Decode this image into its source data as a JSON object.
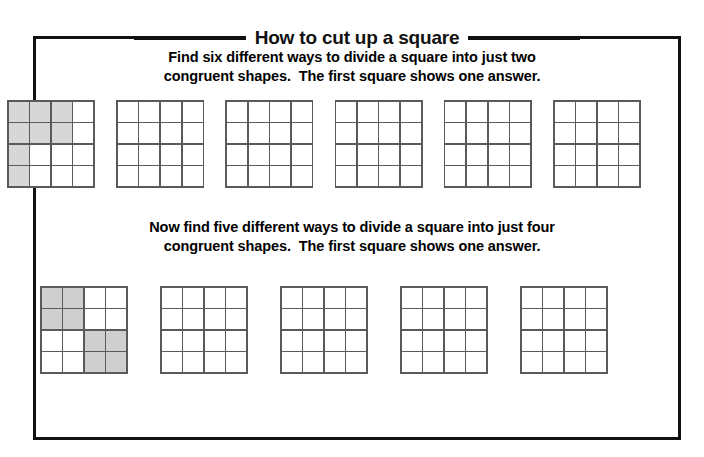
{
  "title": "How to cut up a square",
  "colors": {
    "border": "#111111",
    "grid_line": "#5a5a5a",
    "shade_row1": "#d7d7d7",
    "shade_row2": "#cfcfcf",
    "page_background": "#ffffff"
  },
  "section_1": {
    "instruction_line_1": "Find six different ways to divide a square into just two",
    "instruction_line_2": "congruent shapes.  The first square shows one answer.",
    "grid_count": 6,
    "grid_rows": 4,
    "grid_cols": 4,
    "grids": [
      {
        "label": "example-answer-two-congruent-shapes",
        "shaded_cells": [
          [
            1,
            1,
            1,
            0
          ],
          [
            1,
            1,
            1,
            0
          ],
          [
            1,
            0,
            0,
            0
          ],
          [
            1,
            0,
            0,
            0
          ]
        ]
      },
      {
        "label": "blank-grid",
        "shaded_cells": [
          [
            0,
            0,
            0,
            0
          ],
          [
            0,
            0,
            0,
            0
          ],
          [
            0,
            0,
            0,
            0
          ],
          [
            0,
            0,
            0,
            0
          ]
        ]
      },
      {
        "label": "blank-grid",
        "shaded_cells": [
          [
            0,
            0,
            0,
            0
          ],
          [
            0,
            0,
            0,
            0
          ],
          [
            0,
            0,
            0,
            0
          ],
          [
            0,
            0,
            0,
            0
          ]
        ]
      },
      {
        "label": "blank-grid",
        "shaded_cells": [
          [
            0,
            0,
            0,
            0
          ],
          [
            0,
            0,
            0,
            0
          ],
          [
            0,
            0,
            0,
            0
          ],
          [
            0,
            0,
            0,
            0
          ]
        ]
      },
      {
        "label": "blank-grid",
        "shaded_cells": [
          [
            0,
            0,
            0,
            0
          ],
          [
            0,
            0,
            0,
            0
          ],
          [
            0,
            0,
            0,
            0
          ],
          [
            0,
            0,
            0,
            0
          ]
        ]
      },
      {
        "label": "blank-grid",
        "shaded_cells": [
          [
            0,
            0,
            0,
            0
          ],
          [
            0,
            0,
            0,
            0
          ],
          [
            0,
            0,
            0,
            0
          ],
          [
            0,
            0,
            0,
            0
          ]
        ]
      }
    ]
  },
  "section_2": {
    "instruction_line_1": "Now find five different ways to divide a square into just four",
    "instruction_line_2": "congruent shapes.  The first square shows one answer.",
    "grid_count": 5,
    "grid_rows": 4,
    "grid_cols": 4,
    "grids": [
      {
        "label": "example-answer-four-congruent-shapes",
        "shaded_cells": [
          [
            1,
            1,
            0,
            0
          ],
          [
            1,
            1,
            0,
            0
          ],
          [
            0,
            0,
            1,
            1
          ],
          [
            0,
            0,
            1,
            1
          ]
        ]
      },
      {
        "label": "blank-grid",
        "shaded_cells": [
          [
            0,
            0,
            0,
            0
          ],
          [
            0,
            0,
            0,
            0
          ],
          [
            0,
            0,
            0,
            0
          ],
          [
            0,
            0,
            0,
            0
          ]
        ]
      },
      {
        "label": "blank-grid",
        "shaded_cells": [
          [
            0,
            0,
            0,
            0
          ],
          [
            0,
            0,
            0,
            0
          ],
          [
            0,
            0,
            0,
            0
          ],
          [
            0,
            0,
            0,
            0
          ]
        ]
      },
      {
        "label": "blank-grid",
        "shaded_cells": [
          [
            0,
            0,
            0,
            0
          ],
          [
            0,
            0,
            0,
            0
          ],
          [
            0,
            0,
            0,
            0
          ],
          [
            0,
            0,
            0,
            0
          ]
        ]
      },
      {
        "label": "blank-grid",
        "shaded_cells": [
          [
            0,
            0,
            0,
            0
          ],
          [
            0,
            0,
            0,
            0
          ],
          [
            0,
            0,
            0,
            0
          ],
          [
            0,
            0,
            0,
            0
          ]
        ]
      }
    ]
  }
}
